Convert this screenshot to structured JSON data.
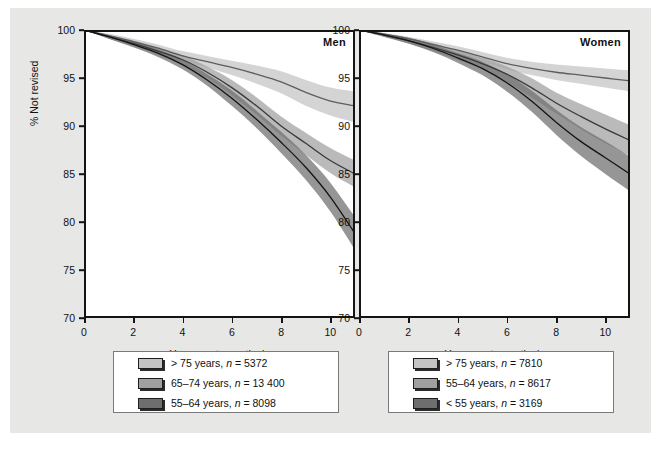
{
  "figure": {
    "background": "#e7e7e6",
    "panel_background": "#ffffff",
    "frame_color": "#141414"
  },
  "axes": {
    "ylabel": "% Not revised",
    "xlabel": "Years postoperatively",
    "yticks": [
      "100",
      "95",
      "90",
      "85",
      "80",
      "75",
      "70"
    ],
    "xticks": [
      "0",
      "2",
      "4",
      "6",
      "8",
      "10"
    ]
  },
  "panels": [
    {
      "title": "Men"
    },
    {
      "title": "Women"
    }
  ],
  "legends": {
    "men": {
      "items": [
        {
          "label": "> 75 years, n = 5372",
          "color": "#c4c4c4"
        },
        {
          "label": "65–74 years, n = 13 400",
          "color": "#a0a0a0"
        },
        {
          "label": "55–64 years, n = 8098",
          "color": "#6e6e6e"
        }
      ]
    },
    "women": {
      "items": [
        {
          "label": "> 75 years, n = 7810",
          "color": "#c4c4c4"
        },
        {
          "label": "55–64 years, n = 8617",
          "color": "#a0a0a0"
        },
        {
          "label": "< 55 years, n = 3169",
          "color": "#6e6e6e"
        }
      ]
    }
  },
  "chart_data": {
    "type": "line",
    "xlabel": "Years postoperatively",
    "ylabel": "% Not revised",
    "xlim": [
      0,
      11
    ],
    "ylim": [
      70,
      100
    ],
    "grid": false,
    "legend_position": "below-panel",
    "x": [
      0,
      1,
      2,
      3,
      4,
      5,
      6,
      7,
      8,
      9,
      10,
      11
    ],
    "panels": [
      {
        "name": "Men",
        "series": [
          {
            "name": "> 75 years, n = 5372",
            "color": "#c4c4c4",
            "values": [
              100,
              99.4,
              98.8,
              98.1,
              97.3,
              96.7,
              96.1,
              95.4,
              94.6,
              93.5,
              92.6,
              92.1
            ],
            "ci_lower": [
              100,
              99.2,
              98.5,
              97.7,
              96.8,
              96.1,
              95.3,
              94.4,
              93.4,
              92.1,
              91.1,
              90.4
            ],
            "ci_upper": [
              100,
              99.6,
              99.1,
              98.5,
              97.8,
              97.3,
              96.8,
              96.3,
              95.7,
              94.8,
              94.0,
              93.6
            ]
          },
          {
            "name": "65–74 years, n = 13 400",
            "color": "#a0a0a0",
            "values": [
              100,
              99.3,
              98.6,
              97.8,
              96.9,
              95.6,
              94.0,
              92.1,
              90.0,
              88.2,
              86.4,
              85.0
            ],
            "ci_lower": [
              100,
              99.1,
              98.3,
              97.4,
              96.4,
              95.0,
              93.2,
              91.2,
              89.0,
              87.0,
              85.1,
              83.6
            ],
            "ci_upper": [
              100,
              99.5,
              98.9,
              98.2,
              97.4,
              96.2,
              94.8,
              93.0,
              91.0,
              89.3,
              87.7,
              86.4
            ]
          },
          {
            "name": "55–64 years, n = 8098",
            "color": "#6e6e6e",
            "values": [
              100,
              99.3,
              98.5,
              97.6,
              96.4,
              94.8,
              92.9,
              90.7,
              88.3,
              85.7,
              82.6,
              78.8
            ],
            "ci_lower": [
              100,
              99.1,
              98.2,
              97.2,
              95.9,
              94.2,
              92.1,
              89.8,
              87.2,
              84.4,
              81.1,
              77.1
            ],
            "ci_upper": [
              100,
              99.5,
              98.8,
              98.0,
              96.9,
              95.4,
              93.7,
              91.6,
              89.4,
              87.0,
              84.1,
              80.5
            ]
          }
        ]
      },
      {
        "name": "Women",
        "series": [
          {
            "name": "> 75 years, n = 7810",
            "color": "#c4c4c4",
            "values": [
              100,
              99.6,
              99.1,
              98.5,
              97.9,
              97.2,
              96.5,
              96.0,
              95.6,
              95.3,
              95.0,
              94.7
            ],
            "ci_lower": [
              100,
              99.4,
              98.9,
              98.2,
              97.5,
              96.7,
              95.9,
              95.3,
              94.8,
              94.4,
              94.0,
              93.6
            ],
            "ci_upper": [
              100,
              99.7,
              99.3,
              98.8,
              98.3,
              97.7,
              97.1,
              96.7,
              96.4,
              96.2,
              96.0,
              95.8
            ]
          },
          {
            "name": "55–64 years, n = 8617",
            "color": "#a0a0a0",
            "values": [
              100,
              99.5,
              98.9,
              98.2,
              97.4,
              96.5,
              95.4,
              94.0,
              92.4,
              91.0,
              89.7,
              88.5
            ],
            "ci_lower": [
              100,
              99.3,
              98.6,
              97.8,
              96.9,
              95.9,
              94.6,
              93.0,
              91.3,
              89.7,
              88.2,
              86.9
            ],
            "ci_upper": [
              100,
              99.6,
              99.2,
              98.6,
              97.9,
              97.1,
              96.2,
              95.0,
              93.5,
              92.3,
              91.2,
              90.1
            ]
          },
          {
            "name": "< 55 years, n = 3169",
            "color": "#6e6e6e",
            "values": [
              100,
              99.5,
              98.9,
              98.1,
              97.1,
              96.0,
              94.5,
              92.6,
              90.4,
              88.4,
              86.7,
              85.0
            ],
            "ci_lower": [
              100,
              99.3,
              98.6,
              97.7,
              96.6,
              95.3,
              93.6,
              91.5,
              89.1,
              86.9,
              85.0,
              83.2
            ],
            "ci_upper": [
              100,
              99.6,
              99.2,
              98.5,
              97.6,
              96.7,
              95.4,
              93.7,
              91.7,
              89.9,
              88.4,
              86.8
            ]
          }
        ]
      }
    ]
  }
}
